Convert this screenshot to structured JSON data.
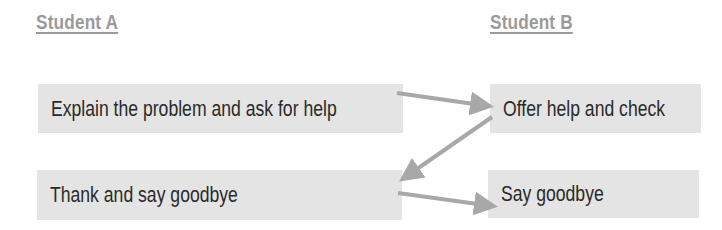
{
  "headings": {
    "student_a": "Student A",
    "student_b": "Student B"
  },
  "boxes": {
    "a1": "Explain the problem and ask for help",
    "b1": "Offer help and check",
    "a2": "Thank and say goodbye",
    "b2": "Say goodbye"
  },
  "arrows": [
    {
      "from": "a1",
      "to": "b1"
    },
    {
      "from": "b1",
      "to": "a2"
    },
    {
      "from": "a2",
      "to": "b2"
    }
  ],
  "colors": {
    "box_bg": "#e4e4e4",
    "arrow": "#a8a8a8",
    "heading": "#9a9a9a"
  }
}
